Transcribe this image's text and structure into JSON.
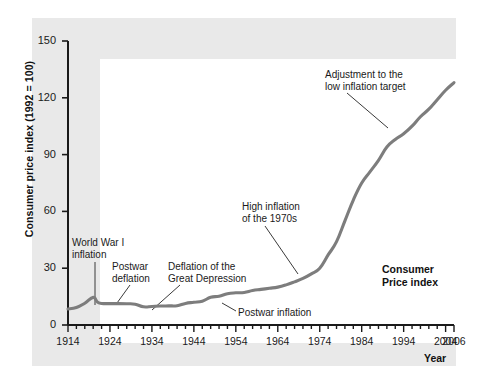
{
  "chart_data": {
    "type": "line",
    "title": "",
    "xlabel": "Year",
    "ylabel": "Consumer price index (1992 = 100)",
    "series_label": "Consumer\nPrice index",
    "xlim": [
      1914,
      2006
    ],
    "ylim": [
      0,
      150
    ],
    "grid": false,
    "legend_position": "inside-right",
    "line_color": "#7d7d7d",
    "xticks": [
      1914,
      1924,
      1934,
      1944,
      1954,
      1964,
      1974,
      1984,
      1994,
      2004,
      2006
    ],
    "xtick_labels": [
      "1914",
      "1924",
      "1934",
      "1944",
      "1954",
      "1964",
      "1974",
      "1984",
      "1994",
      "2004",
      "2006"
    ],
    "xminor_step": 2,
    "yticks": [
      0,
      30,
      60,
      90,
      120,
      150
    ],
    "ytick_labels": [
      "0",
      "30",
      "60",
      "90",
      "120",
      "150"
    ],
    "x": [
      1914,
      1916,
      1918,
      1920,
      1921,
      1922,
      1924,
      1926,
      1928,
      1930,
      1932,
      1934,
      1936,
      1938,
      1940,
      1942,
      1944,
      1946,
      1948,
      1950,
      1952,
      1954,
      1956,
      1958,
      1960,
      1962,
      1964,
      1966,
      1968,
      1970,
      1972,
      1974,
      1976,
      1978,
      1980,
      1982,
      1984,
      1986,
      1988,
      1990,
      1992,
      1994,
      1996,
      1998,
      2000,
      2002,
      2004,
      2006
    ],
    "y": [
      8.5,
      9.2,
      11.5,
      14.6,
      12.1,
      11.4,
      11.3,
      11.3,
      11.2,
      11.0,
      9.6,
      9.8,
      10.0,
      10.1,
      10.2,
      11.4,
      12.0,
      12.6,
      14.6,
      15.2,
      16.5,
      17.0,
      17.2,
      18.2,
      18.8,
      19.4,
      20.0,
      21.2,
      22.8,
      24.6,
      27.0,
      30.0,
      37.0,
      44.0,
      55.0,
      66.0,
      75.0,
      81.0,
      87.0,
      94.0,
      98.0,
      101.0,
      105.0,
      110.0,
      114.0,
      119.0,
      124.0,
      128.0
    ],
    "annotations": [
      {
        "id": "ww1",
        "text": "World War I\ninflation",
        "label_x": 72,
        "label_y": 237,
        "line": [
          95,
          262,
          95,
          305
        ]
      },
      {
        "id": "postwar-deflation",
        "text": "Postwar\ndeflation",
        "label_x": 112,
        "label_y": 261,
        "line": [
          130,
          285,
          117,
          303
        ]
      },
      {
        "id": "great-depression",
        "text": "Deflation of the\nGreat Depression",
        "label_x": 168,
        "label_y": 261,
        "line": [
          180,
          285,
          152,
          310
        ]
      },
      {
        "id": "postwar-inflation",
        "text": "Postwar inflation",
        "label_x": 238,
        "label_y": 307,
        "line": [
          236,
          311,
          222,
          303
        ]
      },
      {
        "id": "high-inflation-1970s",
        "text": "High inflation\nof the 1970s",
        "label_x": 242,
        "label_y": 201,
        "line": [
          265,
          226,
          298,
          274
        ]
      },
      {
        "id": "low-inflation-target",
        "text": "Adjustment to the\nlow inflation target",
        "label_x": 325,
        "label_y": 69,
        "line": [
          347,
          93,
          388,
          128
        ]
      }
    ],
    "series_label_x": 382,
    "series_label_y": 263
  }
}
